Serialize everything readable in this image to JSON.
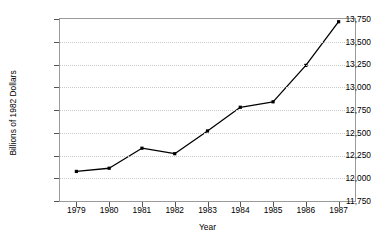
{
  "figure": {
    "title_clipped": "FIGURE 1A.  THE REAL VALUE OF TOTAL PRODUCTION OF GOODS AND SERVICES"
  },
  "chart_data": {
    "type": "line",
    "title": "FIGURE 1A.  THE REAL VALUE OF TOTAL PRODUCTION OF GOODS AND SERVICES",
    "xlabel": "Year",
    "ylabel": "Billions of 1982 Dollars",
    "categories": [
      1979,
      1980,
      1981,
      1982,
      1983,
      1984,
      1985,
      1986,
      1987
    ],
    "values": [
      12075,
      12110,
      12330,
      12270,
      12520,
      12780,
      12840,
      13240,
      13720
    ],
    "ylim": [
      11750,
      13750
    ],
    "yticks": [
      11750,
      12000,
      12250,
      12500,
      12750,
      13000,
      13250,
      13500,
      13750
    ],
    "ytick_labels": [
      "11,750",
      "12,000",
      "12,250",
      "12,500",
      "12,750",
      "13,000",
      "13,250",
      "13,500",
      "13,750"
    ],
    "xtick_labels": [
      "1979",
      "1980",
      "1981",
      "1982",
      "1983",
      "1984",
      "1985",
      "1986",
      "1987"
    ],
    "grid": "horizontal-dotted",
    "legend": null,
    "series_color": "#000000",
    "marker": "square",
    "gridline_color": "#c9c9c9",
    "frame_color": "#9a9a9a"
  }
}
